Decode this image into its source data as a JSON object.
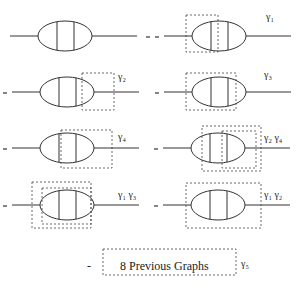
{
  "diagrams": [
    {
      "id": "g0",
      "cx": 65,
      "cy": 36,
      "minus": false,
      "label": "",
      "boxes": [],
      "dashed_lines": []
    },
    {
      "id": "g1",
      "cx": 219,
      "cy": 36,
      "minus": true,
      "label": "γ₁",
      "boxes": [
        [
          186,
          15,
          218,
          52
        ]
      ],
      "dashed_lines": [
        217
      ]
    },
    {
      "id": "g2",
      "cx": 67,
      "cy": 92,
      "minus": true,
      "label": "γ₂",
      "boxes": [
        [
          82,
          73,
          114,
          110
        ]
      ],
      "dashed_lines": [
        82
      ]
    },
    {
      "id": "g3",
      "cx": 219,
      "cy": 92,
      "minus": true,
      "label": "γ₃",
      "boxes": [
        [
          186,
          73,
          236,
          110
        ]
      ],
      "dashed_lines": [
        236
      ]
    },
    {
      "id": "g4",
      "cx": 67,
      "cy": 148,
      "minus": true,
      "label": "γ₂ γ₄",
      "boxes": [
        [
          61,
          130,
          112,
          168
        ]
      ],
      "dashed_lines": [
        63,
        111
      ]
    },
    {
      "id": "g5",
      "cx": 218,
      "cy": 148,
      "minus": true,
      "label": "γ₂ γ₄",
      "boxes": [
        [
          202,
          126,
          261,
          171
        ],
        [
          222,
          131,
          256,
          168
        ]
      ],
      "dashed_lines": [
        222,
        256
      ]
    },
    {
      "id": "g6",
      "cx": 67,
      "cy": 205,
      "minus": true,
      "label": "γ₁ γ₃",
      "boxes": [
        [
          32,
          182,
          91,
          228
        ],
        [
          42,
          188,
          91,
          224
        ]
      ],
      "dashed_lines": [
        74,
        91
      ]
    },
    {
      "id": "g7",
      "cx": 218,
      "cy": 205,
      "minus": true,
      "label": "γ₁ γ₂",
      "boxes": [
        [
          186,
          183,
          261,
          228
        ]
      ],
      "dashed_lines": [
        216,
        227
      ]
    }
  ],
  "labels": {
    "g1": "γ₁",
    "g2": "γ₂",
    "g3": "γ₃",
    "g4": "γ₄",
    "g5": "γ₂ γ₄",
    "g6": "γ₁ γ₃",
    "g7": "γ₁ γ₂"
  },
  "footer": {
    "minus": "-",
    "box_text": "8 Previous Graphs",
    "label": "γ₅"
  }
}
